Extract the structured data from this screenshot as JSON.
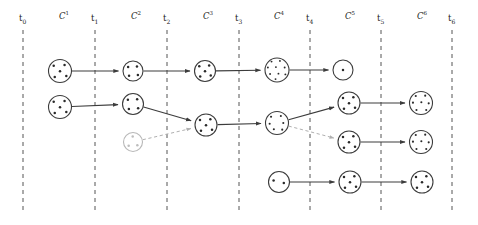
{
  "figure": {
    "type": "cluster-evolution-timeline",
    "background": "#ffffff",
    "width": 478,
    "height": 225,
    "node_stroke": "#3c3c3c",
    "node_stroke_faded": "#b8b8b8",
    "dot_color": "#2a2a2a",
    "dot_color_faded": "#bdbdbd",
    "edge_color": "#3c3c3c",
    "edge_color_dashed": "#b0b0b0",
    "timeline_color": "#555555"
  },
  "timeline": {
    "axis_label_y": 22,
    "line_top": 30,
    "line_bottom": 214,
    "ticks": [
      {
        "id": "t0",
        "label": "t",
        "sub": "0",
        "x": 23
      },
      {
        "id": "t1",
        "label": "t",
        "sub": "1",
        "x": 95
      },
      {
        "id": "t2",
        "label": "t",
        "sub": "2",
        "x": 167
      },
      {
        "id": "t3",
        "label": "t",
        "sub": "3",
        "x": 239
      },
      {
        "id": "t4",
        "label": "t",
        "sub": "4",
        "x": 310
      },
      {
        "id": "t5",
        "label": "t",
        "sub": "5",
        "x": 381
      },
      {
        "id": "t6",
        "label": "t",
        "sub": "6",
        "x": 452
      }
    ]
  },
  "clusterings": [
    {
      "id": "C1",
      "label": "C",
      "sup": "1",
      "x": 59,
      "y": 10
    },
    {
      "id": "C2",
      "label": "C",
      "sup": "2",
      "x": 131,
      "y": 10
    },
    {
      "id": "C3",
      "label": "C",
      "sup": "3",
      "x": 203,
      "y": 10
    },
    {
      "id": "C4",
      "label": "C",
      "sup": "4",
      "x": 274,
      "y": 10
    },
    {
      "id": "C5",
      "label": "C",
      "sup": "5",
      "x": 345,
      "y": 10
    },
    {
      "id": "C6",
      "label": "C",
      "sup": "6",
      "x": 417,
      "y": 10
    }
  ],
  "nodes": [
    {
      "id": "n_r1_t0",
      "cx": 60,
      "cy": 71,
      "r": 11.5,
      "dots": 5,
      "faded": false,
      "row": 1,
      "step": "t0"
    },
    {
      "id": "n_r1_t1",
      "cx": 133,
      "cy": 71,
      "r": 10.0,
      "dots": 4,
      "faded": false,
      "row": 1,
      "step": "t1"
    },
    {
      "id": "n_r1_t2",
      "cx": 205,
      "cy": 71,
      "r": 10.5,
      "dots": 5,
      "faded": false,
      "row": 1,
      "step": "t2"
    },
    {
      "id": "n_r1_t3",
      "cx": 277,
      "cy": 70,
      "r": 12.0,
      "dots": 9,
      "faded": false,
      "row": 1,
      "step": "t3"
    },
    {
      "id": "n_r1_t4",
      "cx": 343,
      "cy": 70,
      "r": 10.0,
      "dots": 1,
      "faded": false,
      "row": 1,
      "step": "t4"
    },
    {
      "id": "n_r2_t0",
      "cx": 60,
      "cy": 107,
      "r": 11.5,
      "dots": 5,
      "faded": false,
      "row": 2,
      "step": "t0"
    },
    {
      "id": "n_r2_t1",
      "cx": 133,
      "cy": 104,
      "r": 10.5,
      "dots": 4,
      "faded": false,
      "row": 2,
      "step": "t1"
    },
    {
      "id": "n_r3_t1",
      "cx": 133,
      "cy": 142,
      "r": 9.5,
      "dots": 3,
      "faded": true,
      "row": 3,
      "step": "t1"
    },
    {
      "id": "n_r2_t2",
      "cx": 206,
      "cy": 125,
      "r": 11.0,
      "dots": 5,
      "faded": false,
      "row": 2,
      "step": "t2"
    },
    {
      "id": "n_r2_t3",
      "cx": 277,
      "cy": 123,
      "r": 11.5,
      "dots": 6,
      "faded": false,
      "row": 2,
      "step": "t3"
    },
    {
      "id": "n_r2_t4",
      "cx": 349,
      "cy": 103,
      "r": 11.0,
      "dots": 5,
      "faded": false,
      "row": 2,
      "step": "t4"
    },
    {
      "id": "n_r3_t4",
      "cx": 349,
      "cy": 142,
      "r": 11.0,
      "dots": 5,
      "faded": false,
      "row": 3,
      "step": "t4"
    },
    {
      "id": "n_r2_t5",
      "cx": 421,
      "cy": 103,
      "r": 11.5,
      "dots": 7,
      "faded": false,
      "row": 2,
      "step": "t5"
    },
    {
      "id": "n_r3_t5",
      "cx": 421,
      "cy": 142,
      "r": 11.5,
      "dots": 7,
      "faded": false,
      "row": 3,
      "step": "t5"
    },
    {
      "id": "n_r4_t2",
      "cx": 279,
      "cy": 182,
      "r": 10.5,
      "dots": 2,
      "faded": false,
      "row": 4,
      "step": "t3"
    },
    {
      "id": "n_r4_t3",
      "cx": 350,
      "cy": 182,
      "r": 11.0,
      "dots": 5,
      "faded": false,
      "row": 4,
      "step": "t4"
    },
    {
      "id": "n_r4_t4",
      "cx": 422,
      "cy": 182,
      "r": 11.0,
      "dots": 5,
      "faded": false,
      "row": 4,
      "step": "t5"
    }
  ],
  "edges": [
    {
      "id": "e1",
      "from": "n_r1_t0",
      "to": "n_r1_t1",
      "style": "solid"
    },
    {
      "id": "e2",
      "from": "n_r1_t1",
      "to": "n_r1_t2",
      "style": "solid"
    },
    {
      "id": "e3",
      "from": "n_r1_t2",
      "to": "n_r1_t3",
      "style": "solid"
    },
    {
      "id": "e4",
      "from": "n_r1_t3",
      "to": "n_r1_t4",
      "style": "solid"
    },
    {
      "id": "e5",
      "from": "n_r2_t0",
      "to": "n_r2_t1",
      "style": "solid"
    },
    {
      "id": "e6",
      "from": "n_r2_t1",
      "to": "n_r2_t2",
      "style": "solid"
    },
    {
      "id": "e7",
      "from": "n_r3_t1",
      "to": "n_r2_t2",
      "style": "dashed"
    },
    {
      "id": "e8",
      "from": "n_r2_t2",
      "to": "n_r2_t3",
      "style": "solid"
    },
    {
      "id": "e9",
      "from": "n_r2_t3",
      "to": "n_r2_t4",
      "style": "solid"
    },
    {
      "id": "e10",
      "from": "n_r2_t3",
      "to": "n_r3_t4",
      "style": "dashed"
    },
    {
      "id": "e11",
      "from": "n_r2_t4",
      "to": "n_r2_t5",
      "style": "solid"
    },
    {
      "id": "e12",
      "from": "n_r3_t4",
      "to": "n_r3_t5",
      "style": "solid"
    },
    {
      "id": "e13",
      "from": "n_r4_t2",
      "to": "n_r4_t3",
      "style": "solid"
    },
    {
      "id": "e14",
      "from": "n_r4_t3",
      "to": "n_r4_t4",
      "style": "solid"
    }
  ],
  "dot_layouts": {
    "1": [
      [
        0,
        0
      ]
    ],
    "2": [
      [
        -0.34,
        -0.1
      ],
      [
        0.3,
        0.06
      ]
    ],
    "3": [
      [
        -0.02,
        -0.38
      ],
      [
        -0.3,
        0.26
      ],
      [
        0.3,
        0.22
      ]
    ],
    "4": [
      [
        -0.32,
        -0.26
      ],
      [
        0.26,
        -0.3
      ],
      [
        -0.26,
        0.32
      ],
      [
        0.32,
        0.26
      ]
    ],
    "5": [
      [
        -0.36,
        -0.3
      ],
      [
        0.26,
        -0.34
      ],
      [
        0.0,
        0.02
      ],
      [
        -0.3,
        0.34
      ],
      [
        0.36,
        0.28
      ]
    ],
    "6": [
      [
        -0.34,
        -0.36
      ],
      [
        0.22,
        -0.4
      ],
      [
        -0.42,
        0.04
      ],
      [
        0.36,
        0.0
      ],
      [
        -0.18,
        0.36
      ],
      [
        0.3,
        0.38
      ]
    ],
    "7": [
      [
        -0.3,
        -0.4
      ],
      [
        0.24,
        -0.42
      ],
      [
        -0.46,
        -0.02
      ],
      [
        0.02,
        -0.04
      ],
      [
        0.44,
        0.02
      ],
      [
        -0.26,
        0.4
      ],
      [
        0.3,
        0.4
      ]
    ],
    "9": [
      [
        -0.3,
        -0.46
      ],
      [
        0.16,
        -0.5
      ],
      [
        -0.5,
        -0.14
      ],
      [
        -0.06,
        -0.16
      ],
      [
        0.42,
        -0.14
      ],
      [
        -0.38,
        0.22
      ],
      [
        0.08,
        0.2
      ],
      [
        0.46,
        0.24
      ],
      [
        -0.08,
        0.5
      ]
    ]
  }
}
